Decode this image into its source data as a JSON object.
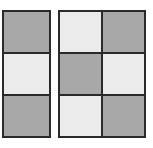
{
  "colors": {
    "dark": "#a8a8a8",
    "light": "#ebebeb",
    "border": "#2a2a2a"
  },
  "left_grid": {
    "columns": 1,
    "rows": 3,
    "cells": [
      "dark",
      "light",
      "dark"
    ]
  },
  "right_grid": {
    "columns": 2,
    "rows": 3,
    "cells": [
      "light",
      "dark",
      "dark",
      "light",
      "light",
      "dark"
    ]
  }
}
